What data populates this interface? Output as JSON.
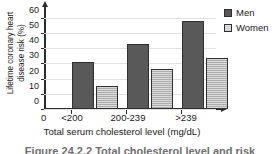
{
  "chart_data": {
    "type": "bar",
    "title": "",
    "xlabel": "Total serum cholesterol level (mg/dL)",
    "ylabel": "Lifetime coronary heart disease risk (%)",
    "ylabel_line1": "Lifetime coronary heart",
    "ylabel_line2": "disease risk (%)",
    "categories": [
      "<200",
      "200-239",
      ">239"
    ],
    "origin_label": "0",
    "series": [
      {
        "name": "Men",
        "values": [
          31,
          43,
          57.5
        ],
        "color": "#595959"
      },
      {
        "name": "Women",
        "values": [
          15,
          26.5,
          33.5
        ],
        "color": "#adadad"
      }
    ],
    "ylim": [
      0,
      65
    ],
    "yticks": [
      0,
      10,
      20,
      30,
      40,
      50,
      60
    ],
    "ytick_labels": [
      "0",
      "10",
      "20",
      "30",
      "40",
      "50",
      "60"
    ],
    "grid": true,
    "grid_axis": "y",
    "legend_position": "top-right"
  },
  "legend": {
    "items": [
      {
        "label": "Men",
        "swatch": "men-swatch-icon"
      },
      {
        "label": "Women",
        "swatch": "women-swatch-icon"
      }
    ]
  },
  "caption": {
    "text": "Figure 24.2.2  Total cholesterol level and risk"
  }
}
